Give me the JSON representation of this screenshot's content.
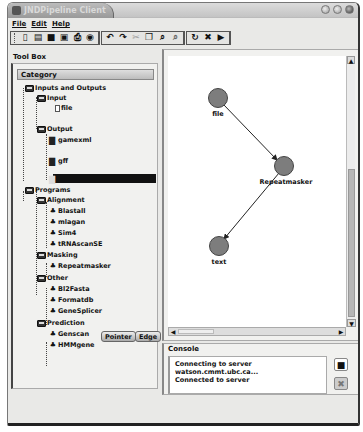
{
  "window": {
    "title": "JNDPipeline Client"
  },
  "menubar": {
    "items": [
      "File",
      "Edit",
      "Help"
    ]
  },
  "toolbar": {
    "groups": [
      [
        "new-icon",
        "open-icon",
        "save-icon",
        "save-as-icon",
        "print-icon",
        "settings-icon"
      ],
      [
        "undo-icon",
        "redo-icon",
        "cut-icon",
        "copy-icon",
        "zoom-in-icon",
        "zoom-out-icon"
      ],
      [
        "refresh-icon",
        "stop-icon",
        "run-icon"
      ]
    ],
    "glyphs": {
      "new-icon": "▯",
      "open-icon": "▤",
      "save-icon": "■",
      "save-as-icon": "▣",
      "print-icon": "⎙",
      "settings-icon": "◉",
      "undo-icon": "↶",
      "redo-icon": "↷",
      "cut-icon": "✂",
      "copy-icon": "❐",
      "zoom-in-icon": "⌕",
      "zoom-out-icon": "⌕",
      "refresh-icon": "↻",
      "stop-icon": "✖",
      "run-icon": "▶"
    }
  },
  "toolbox": {
    "label": "Tool Box",
    "category_header": "Category",
    "tree": [
      {
        "label": "Inputs and Outputs",
        "type": "folder",
        "level": 0
      },
      {
        "label": "Input",
        "type": "folder",
        "level": 1
      },
      {
        "label": "file",
        "type": "file",
        "level": 2
      },
      {
        "label": "Output",
        "type": "folder",
        "level": 1
      },
      {
        "label": "gamexml",
        "type": "prog",
        "level": 2
      },
      {
        "label": "gff",
        "type": "prog",
        "level": 2
      },
      {
        "label": "text",
        "type": "prog",
        "level": 2,
        "selected": true
      },
      {
        "label": "Programs",
        "type": "folder",
        "level": 0
      },
      {
        "label": "Alignment",
        "type": "folder",
        "level": 1
      },
      {
        "label": "Blastall",
        "type": "gear",
        "level": 2
      },
      {
        "label": "mlagan",
        "type": "gear",
        "level": 2
      },
      {
        "label": "Sim4",
        "type": "gear",
        "level": 2
      },
      {
        "label": "tRNAscanSE",
        "type": "gear",
        "level": 2
      },
      {
        "label": "Masking",
        "type": "folder",
        "level": 1
      },
      {
        "label": "Repeatmasker",
        "type": "gear",
        "level": 2
      },
      {
        "label": "Other",
        "type": "folder",
        "level": 1
      },
      {
        "label": "Bl2Fasta",
        "type": "gear",
        "level": 2
      },
      {
        "label": "Formatdb",
        "type": "gear",
        "level": 2
      },
      {
        "label": "GeneSplicer",
        "type": "gear",
        "level": 2
      },
      {
        "label": "Prediction",
        "type": "folder",
        "level": 1
      },
      {
        "label": "Genscan",
        "type": "gear",
        "level": 2
      },
      {
        "label": "HMMgene",
        "type": "gear",
        "level": 2
      }
    ],
    "buttons": {
      "pointer": "Pointer",
      "edge": "Edge"
    }
  },
  "canvas": {
    "nodes": [
      {
        "id": "file",
        "label": "file",
        "x": 50,
        "y": 42
      },
      {
        "id": "repeatmasker",
        "label": "Repeatmasker",
        "x": 116,
        "y": 110
      },
      {
        "id": "text",
        "label": "text",
        "x": 51,
        "y": 190
      }
    ],
    "edges": [
      {
        "from": "file",
        "to": "repeatmasker"
      },
      {
        "from": "repeatmasker",
        "to": "text"
      }
    ],
    "node_color": "#7d7d7d"
  },
  "console": {
    "label": "Console",
    "lines": [
      "Connecting to server",
      "watson.cmmt.ubc.ca...",
      "Connected to server"
    ],
    "save_glyph": "■",
    "clear_glyph": "✖"
  }
}
